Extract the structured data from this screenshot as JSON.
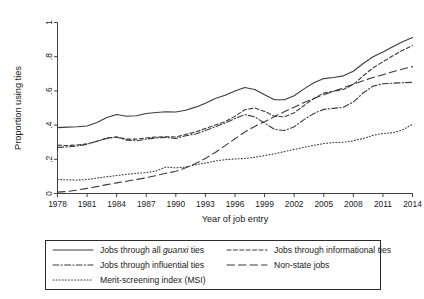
{
  "chart_data": {
    "type": "line",
    "title": "",
    "xlabel": "Year of job entry",
    "ylabel": "Proportion using ties",
    "xlim": [
      1978,
      2014
    ],
    "ylim": [
      0,
      1
    ],
    "grid": false,
    "legend_position": "bottom",
    "xticks": [
      1978,
      1981,
      1984,
      1987,
      1990,
      1993,
      1996,
      1999,
      2002,
      2005,
      2008,
      2011,
      2014
    ],
    "xtick_labels": [
      "1978",
      "1981",
      "1984",
      "1987",
      "1990",
      "1993",
      "1996",
      "1999",
      "2002",
      "2005",
      "2008",
      "2011",
      "2014"
    ],
    "yticks": [
      0,
      0.2,
      0.4,
      0.6,
      0.8,
      1
    ],
    "ytick_labels": [
      "0",
      ".2",
      ".4",
      ".6",
      ".8",
      "1"
    ],
    "x": [
      1978,
      1979,
      1980,
      1981,
      1982,
      1983,
      1984,
      1985,
      1986,
      1987,
      1988,
      1989,
      1990,
      1991,
      1992,
      1993,
      1994,
      1995,
      1996,
      1997,
      1998,
      1999,
      2000,
      2001,
      2002,
      2003,
      2004,
      2005,
      2006,
      2007,
      2008,
      2009,
      2010,
      2011,
      2012,
      2013,
      2014
    ],
    "series": [
      {
        "name": "Jobs through all guanxi ties",
        "style": "solid",
        "values": [
          0.385,
          0.388,
          0.39,
          0.395,
          0.415,
          0.445,
          0.462,
          0.452,
          0.455,
          0.468,
          0.474,
          0.478,
          0.477,
          0.487,
          0.505,
          0.528,
          0.555,
          0.575,
          0.6,
          0.62,
          0.608,
          0.578,
          0.548,
          0.548,
          0.572,
          0.612,
          0.648,
          0.672,
          0.678,
          0.688,
          0.715,
          0.76,
          0.8,
          0.828,
          0.858,
          0.888,
          0.912
        ]
      },
      {
        "name": "Jobs through informational ties",
        "style": "dashed-short",
        "values": [
          0.283,
          0.28,
          0.284,
          0.29,
          0.305,
          0.325,
          0.33,
          0.318,
          0.318,
          0.325,
          0.33,
          0.332,
          0.33,
          0.345,
          0.36,
          0.38,
          0.4,
          0.42,
          0.452,
          0.49,
          0.5,
          0.48,
          0.452,
          0.448,
          0.472,
          0.515,
          0.555,
          0.588,
          0.598,
          0.608,
          0.638,
          0.688,
          0.735,
          0.77,
          0.805,
          0.838,
          0.865
        ]
      },
      {
        "name": "Jobs through influential ties",
        "style": "dashdot",
        "values": [
          0.27,
          0.272,
          0.278,
          0.288,
          0.305,
          0.322,
          0.33,
          0.312,
          0.308,
          0.318,
          0.325,
          0.328,
          0.322,
          0.338,
          0.348,
          0.368,
          0.39,
          0.412,
          0.438,
          0.462,
          0.448,
          0.412,
          0.375,
          0.368,
          0.39,
          0.432,
          0.468,
          0.492,
          0.498,
          0.505,
          0.535,
          0.588,
          0.628,
          0.642,
          0.645,
          0.648,
          0.65
        ]
      },
      {
        "name": "Non-state jobs",
        "style": "dashed-long",
        "values": [
          0.008,
          0.012,
          0.02,
          0.03,
          0.04,
          0.052,
          0.062,
          0.072,
          0.082,
          0.092,
          0.105,
          0.118,
          0.13,
          0.15,
          0.175,
          0.205,
          0.24,
          0.28,
          0.32,
          0.36,
          0.392,
          0.42,
          0.45,
          0.478,
          0.505,
          0.532,
          0.556,
          0.578,
          0.598,
          0.618,
          0.638,
          0.66,
          0.678,
          0.695,
          0.712,
          0.728,
          0.742
        ]
      },
      {
        "name": "Merit-screening index (MSI)",
        "style": "dotted",
        "values": [
          0.082,
          0.08,
          0.079,
          0.082,
          0.09,
          0.098,
          0.105,
          0.112,
          0.118,
          0.122,
          0.132,
          0.155,
          0.15,
          0.155,
          0.168,
          0.178,
          0.19,
          0.198,
          0.202,
          0.205,
          0.212,
          0.222,
          0.232,
          0.245,
          0.258,
          0.27,
          0.282,
          0.292,
          0.298,
          0.3,
          0.308,
          0.322,
          0.34,
          0.352,
          0.355,
          0.372,
          0.405
        ]
      }
    ]
  },
  "legend": {
    "entries": [
      {
        "label_prefix": "Jobs through all ",
        "label_italic": "guanxi",
        "label_suffix": " ties",
        "style": "solid"
      },
      {
        "label_prefix": "Jobs through informational ties",
        "label_italic": "",
        "label_suffix": "",
        "style": "dashed-short"
      },
      {
        "label_prefix": "Jobs through influential ties",
        "label_italic": "",
        "label_suffix": "",
        "style": "dashdot"
      },
      {
        "label_prefix": "Non-state jobs",
        "label_italic": "",
        "label_suffix": "",
        "style": "dashed-long"
      },
      {
        "label_prefix": "Merit-screening index (MSI)",
        "label_italic": "",
        "label_suffix": "",
        "style": "dotted"
      }
    ]
  },
  "colors": {
    "line": "#3b3b3b",
    "axis": "#2b2b2b",
    "text": "#1a1a1a",
    "background": "#ffffff"
  }
}
